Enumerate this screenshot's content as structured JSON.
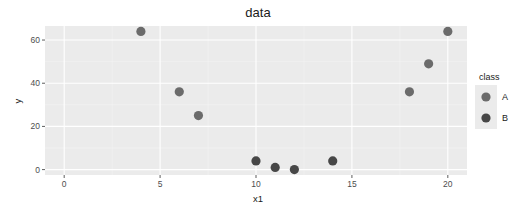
{
  "chart_data": {
    "type": "scatter",
    "title": "data",
    "xlabel": "x1",
    "ylabel": "y",
    "xlim": [
      -1,
      21
    ],
    "ylim": [
      -2.5,
      66.5
    ],
    "x_ticks": [
      0,
      5,
      10,
      15,
      20
    ],
    "y_ticks": [
      0,
      20,
      40,
      60
    ],
    "grid": true,
    "legend_position": "right",
    "legend_title": "class",
    "series": [
      {
        "name": "A",
        "color": "#6b6b6b",
        "points": [
          {
            "x": 4,
            "y": 64
          },
          {
            "x": 6,
            "y": 36
          },
          {
            "x": 7,
            "y": 25
          },
          {
            "x": 18,
            "y": 36
          },
          {
            "x": 19,
            "y": 49
          },
          {
            "x": 20,
            "y": 64
          }
        ]
      },
      {
        "name": "B",
        "color": "#474747",
        "points": [
          {
            "x": 10,
            "y": 4
          },
          {
            "x": 11,
            "y": 1
          },
          {
            "x": 12,
            "y": 0
          },
          {
            "x": 14,
            "y": 4
          }
        ]
      }
    ]
  },
  "colors": {
    "panel_bg": "#ebebeb",
    "grid_major": "#ffffff",
    "grid_minor": "#f5f5f5",
    "legend_key_bg": "#ebebeb"
  }
}
